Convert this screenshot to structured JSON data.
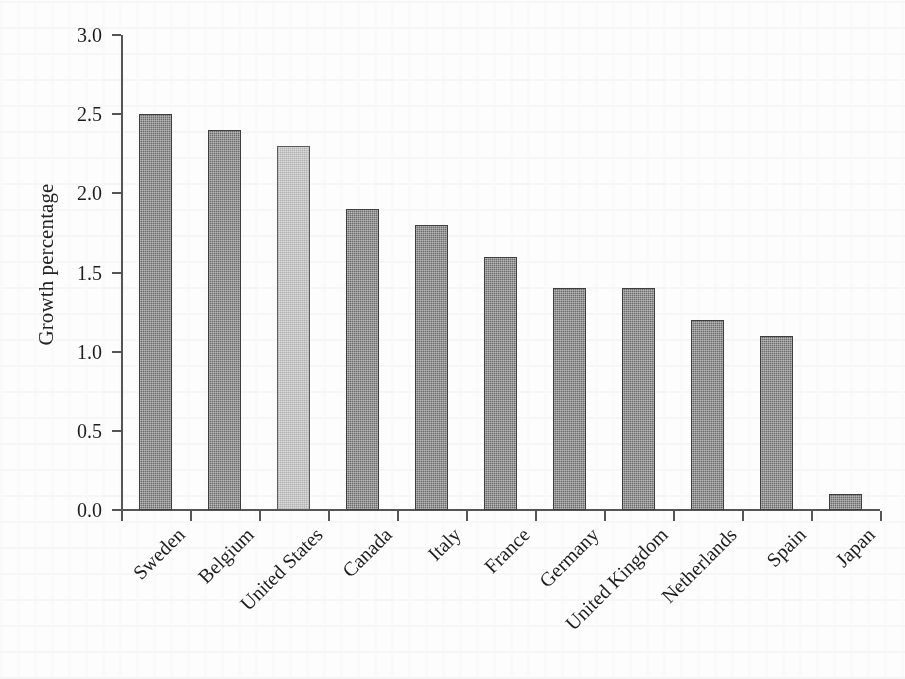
{
  "chart_data": {
    "type": "bar",
    "title": "",
    "subtitle": "",
    "xlabel": "",
    "ylabel": "Growth percentage",
    "categories": [
      "Sweden",
      "Belgium",
      "United States",
      "Canada",
      "Italy",
      "France",
      "Germany",
      "United Kingdom",
      "Netherlands",
      "Spain",
      "Japan"
    ],
    "values": [
      2.5,
      2.4,
      2.3,
      1.9,
      1.8,
      1.6,
      1.4,
      1.4,
      1.2,
      1.1,
      0.1
    ],
    "highlighted_category": "United States",
    "ylim": [
      0.0,
      3.0
    ],
    "ytick_labels": [
      "0.0",
      "0.5",
      "1.0",
      "1.5",
      "2.0",
      "2.5",
      "3.0"
    ],
    "ytick_values": [
      0.0,
      0.5,
      1.0,
      1.5,
      2.0,
      2.5,
      3.0
    ],
    "grid": false,
    "legend": null,
    "annotations": [],
    "colors": {
      "bar_default": "#6d6d6d",
      "bar_highlight": "#dcdcdc",
      "bar_border": "#3e3e3e",
      "axis": "#555555",
      "text": "#1d1d1d",
      "background": "#fdfdfd"
    }
  }
}
